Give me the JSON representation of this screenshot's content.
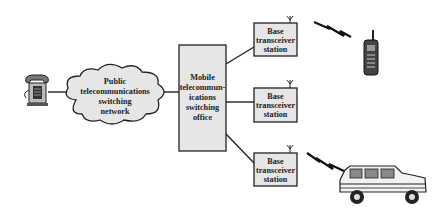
{
  "diagram": {
    "type": "cellular network architecture",
    "nodes": {
      "telephone": {
        "label": ""
      },
      "pstn": {
        "lines": [
          "Public",
          "telecommunications",
          "switching",
          "network"
        ]
      },
      "mtso": {
        "lines": [
          "Mobile",
          "telecommun-",
          "ications",
          "switching",
          "office"
        ]
      },
      "bts": [
        {
          "lines": [
            "Base",
            "transceiver",
            "station"
          ]
        },
        {
          "lines": [
            "Base",
            "transceiver",
            "station"
          ]
        },
        {
          "lines": [
            "Base",
            "transceiver",
            "station"
          ]
        }
      ],
      "mobile_phone": {
        "label": ""
      },
      "car": {
        "label": ""
      }
    },
    "edges": [
      [
        "telephone",
        "pstn"
      ],
      [
        "pstn",
        "mtso"
      ],
      [
        "mtso",
        "bts.0"
      ],
      [
        "mtso",
        "bts.1"
      ],
      [
        "mtso",
        "bts.2"
      ],
      [
        "bts.0",
        "mobile_phone",
        "wireless"
      ],
      [
        "bts.2",
        "car",
        "wireless"
      ]
    ]
  }
}
